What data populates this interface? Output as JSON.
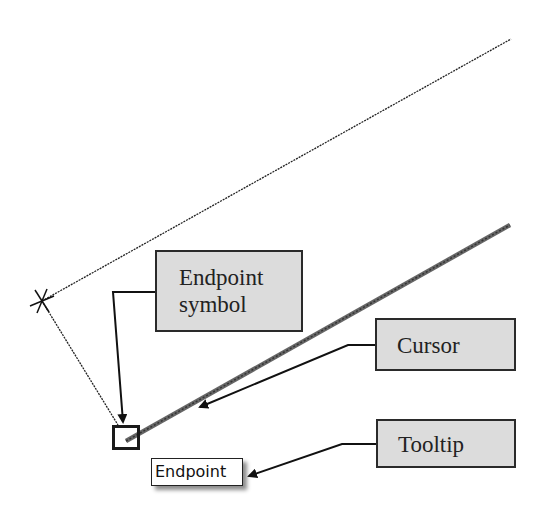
{
  "diagram": {
    "callouts": {
      "endpoint_symbol": "Endpoint symbol",
      "endpoint_symbol_line1": "Endpoint",
      "endpoint_symbol_line2": "symbol",
      "cursor": "Cursor",
      "tooltip": "Tooltip"
    },
    "tooltip_text": "Endpoint",
    "colors": {
      "callout_fill": "#dcdcdc",
      "callout_border": "#2a2a2a",
      "line": "#222222",
      "cursor_line": "#555555"
    }
  }
}
